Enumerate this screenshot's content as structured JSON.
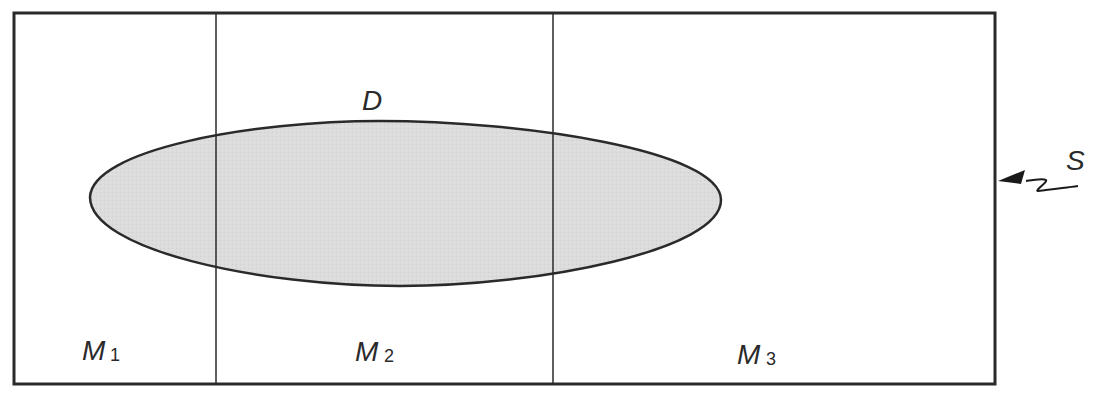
{
  "diagram": {
    "region_label": "D",
    "source_label": "S",
    "compartments": [
      {
        "label": "M",
        "subscript": "1"
      },
      {
        "label": "M",
        "subscript": "2"
      },
      {
        "label": "M",
        "subscript": "3"
      }
    ],
    "colors": {
      "stroke": "#2a2a2a",
      "region_fill": "#d9d9d9",
      "background": "#ffffff"
    }
  }
}
